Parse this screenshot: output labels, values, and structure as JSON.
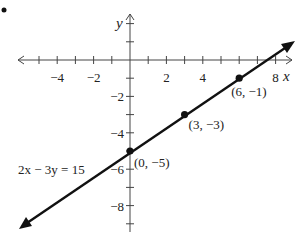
{
  "chart_data": {
    "type": "line",
    "title": "",
    "equation": "2x − 3y = 15",
    "xlabel": "x",
    "ylabel": "y",
    "xlim": [
      -6.5,
      9
    ],
    "ylim": [
      -9.5,
      2.5
    ],
    "grid": false,
    "x_ticks": [
      -5,
      -4,
      -3,
      -2,
      -1,
      1,
      2,
      3,
      4,
      5,
      6,
      7,
      8
    ],
    "y_ticks": [
      2,
      1,
      -1,
      -2,
      -3,
      -4,
      -5,
      -6,
      -7,
      -8,
      -9
    ],
    "x_tick_labels": [
      {
        "value": -4,
        "text": "−4"
      },
      {
        "value": -2,
        "text": "−2"
      },
      {
        "value": 2,
        "text": "2"
      },
      {
        "value": 4,
        "text": "4"
      },
      {
        "value": 8,
        "text": "8"
      }
    ],
    "y_tick_labels": [
      {
        "value": -2,
        "text": "−2"
      },
      {
        "value": -4,
        "text": "−4"
      },
      {
        "value": -6,
        "text": "−6"
      },
      {
        "value": -8,
        "text": "−8"
      }
    ],
    "series": [
      {
        "name": "2x − 3y = 15",
        "slope": 0.6667,
        "intercept": -5,
        "x": [
          0,
          3,
          6
        ],
        "y": [
          -5,
          -3,
          -1
        ]
      }
    ],
    "points": [
      {
        "x": 0,
        "y": -5,
        "label": "(0, −5)"
      },
      {
        "x": 3,
        "y": -3,
        "label": "(3, −3)"
      },
      {
        "x": 6,
        "y": -1,
        "label": "(6, −1)"
      }
    ],
    "annotations": [
      {
        "text": "2x − 3y = 15",
        "near": {
          "x": -3.5,
          "y": -5.5
        }
      }
    ],
    "color": "#111111"
  }
}
